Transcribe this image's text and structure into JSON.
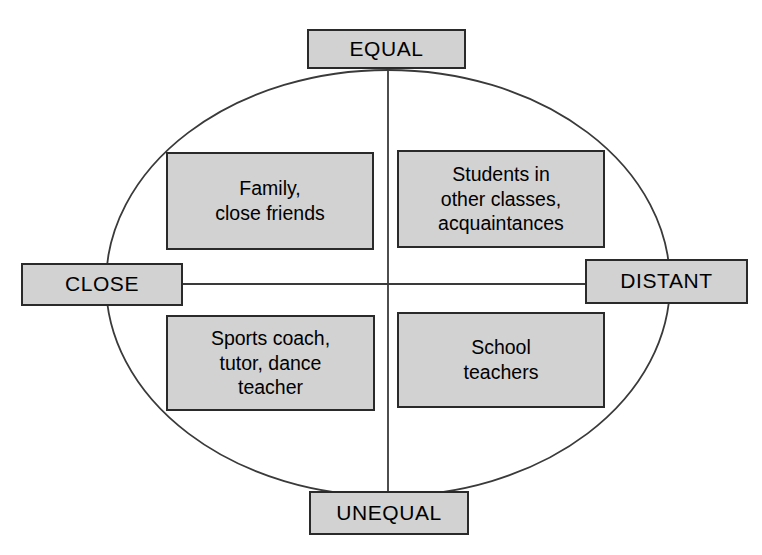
{
  "diagram": {
    "type": "two-axis-quadrant-ellipse",
    "shape_name": "ellipse-with-crossed-axes",
    "axes": {
      "vertical": {
        "top_label": "EQUAL",
        "bottom_label": "UNEQUAL"
      },
      "horizontal": {
        "left_label": "CLOSE",
        "right_label": "DISTANT"
      }
    },
    "endpoints": [
      {
        "id": "equal",
        "label": "EQUAL",
        "position": "top"
      },
      {
        "id": "distant",
        "label": "DISTANT",
        "position": "right"
      },
      {
        "id": "unequal",
        "label": "UNEQUAL",
        "position": "bottom"
      },
      {
        "id": "close",
        "label": "CLOSE",
        "position": "left"
      }
    ],
    "quadrants": [
      {
        "id": "equal-close",
        "position": "top-left",
        "axis_combination": "EQUAL + CLOSE",
        "label": "Family,\nclose friends"
      },
      {
        "id": "equal-distant",
        "position": "top-right",
        "axis_combination": "EQUAL + DISTANT",
        "label": "Students in\nother classes,\nacquaintances"
      },
      {
        "id": "unequal-close",
        "position": "bottom-left",
        "axis_combination": "UNEQUAL + CLOSE",
        "label": "Sports coach,\ntutor, dance\nteacher"
      },
      {
        "id": "unequal-distant",
        "position": "bottom-right",
        "axis_combination": "UNEQUAL + DISTANT",
        "label": "School\nteachers"
      }
    ],
    "colors": {
      "box_fill": "#d2d2d2",
      "box_border": "#2a2a2a",
      "line": "#3a3a3a",
      "background": "#ffffff",
      "text": "#000000"
    }
  }
}
